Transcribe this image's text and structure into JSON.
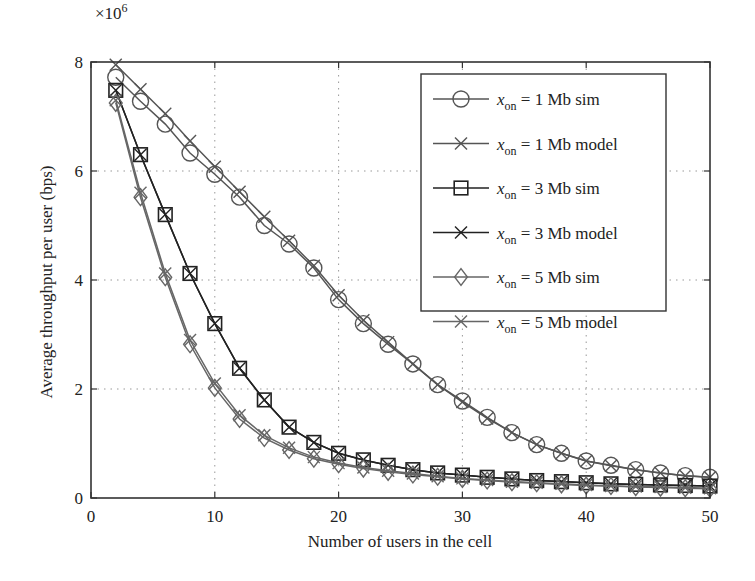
{
  "chart_data": {
    "type": "line",
    "title": "",
    "xlabel": "Number of users in the cell",
    "ylabel": "Average throughput per user (bps)",
    "y_multiplier_label": "×10^6",
    "y_multiplier_base": "×10",
    "y_multiplier_exp": "6",
    "xlim": [
      0,
      50
    ],
    "ylim": [
      0,
      8
    ],
    "xticks": [
      0,
      10,
      20,
      30,
      40,
      50
    ],
    "yticks": [
      0,
      2,
      4,
      6,
      8
    ],
    "grid": true,
    "grid_style": "dotted",
    "legend_position": "upper right (inside)",
    "x": [
      2,
      4,
      6,
      8,
      10,
      12,
      14,
      16,
      18,
      20,
      22,
      24,
      26,
      28,
      30,
      32,
      34,
      36,
      38,
      40,
      42,
      44,
      46,
      48,
      50
    ],
    "series": [
      {
        "name": "x_on = 1 Mb sim",
        "label_var": "x",
        "label_sub": "on",
        "label_rest": " = 1 Mb sim",
        "marker": "circle",
        "color": "#555555",
        "values": [
          7.72,
          7.28,
          6.86,
          6.33,
          5.94,
          5.52,
          5.0,
          4.66,
          4.22,
          3.64,
          3.2,
          2.82,
          2.46,
          2.08,
          1.78,
          1.48,
          1.2,
          0.98,
          0.82,
          0.68,
          0.6,
          0.52,
          0.46,
          0.41,
          0.38
        ]
      },
      {
        "name": "x_on = 1 Mb model",
        "label_var": "x",
        "label_sub": "on",
        "label_rest": " = 1 Mb model",
        "marker": "x",
        "color": "#555555",
        "values": [
          7.95,
          7.5,
          7.05,
          6.55,
          6.08,
          5.62,
          5.16,
          4.72,
          4.26,
          3.72,
          3.26,
          2.86,
          2.46,
          2.08,
          1.76,
          1.46,
          1.2,
          0.98,
          0.82,
          0.68,
          0.59,
          0.52,
          0.46,
          0.41,
          0.38
        ]
      },
      {
        "name": "x_on = 3 Mb sim",
        "label_var": "x",
        "label_sub": "on",
        "label_rest": " = 3 Mb sim",
        "marker": "square",
        "color": "#222222",
        "values": [
          7.48,
          6.3,
          5.2,
          4.12,
          3.2,
          2.38,
          1.8,
          1.3,
          1.02,
          0.82,
          0.7,
          0.6,
          0.52,
          0.46,
          0.42,
          0.38,
          0.35,
          0.32,
          0.3,
          0.28,
          0.26,
          0.25,
          0.24,
          0.23,
          0.22
        ]
      },
      {
        "name": "x_on = 3 Mb model",
        "label_var": "x",
        "label_sub": "on",
        "label_rest": " = 3 Mb model",
        "marker": "x",
        "color": "#222222",
        "values": [
          7.48,
          6.3,
          5.2,
          4.12,
          3.2,
          2.38,
          1.8,
          1.3,
          1.02,
          0.82,
          0.7,
          0.6,
          0.52,
          0.46,
          0.42,
          0.38,
          0.35,
          0.32,
          0.3,
          0.28,
          0.26,
          0.25,
          0.24,
          0.23,
          0.22
        ]
      },
      {
        "name": "x_on = 5 Mb sim",
        "label_var": "x",
        "label_sub": "on",
        "label_rest": " = 5 Mb sim",
        "marker": "diamond",
        "color": "#666666",
        "values": [
          7.25,
          5.52,
          4.05,
          2.82,
          2.02,
          1.45,
          1.1,
          0.88,
          0.72,
          0.62,
          0.54,
          0.48,
          0.43,
          0.39,
          0.35,
          0.32,
          0.29,
          0.27,
          0.25,
          0.23,
          0.22,
          0.2,
          0.19,
          0.18,
          0.17
        ]
      },
      {
        "name": "x_on = 5 Mb model",
        "label_var": "x",
        "label_sub": "on",
        "label_rest": " = 5 Mb model",
        "marker": "x",
        "color": "#666666",
        "values": [
          7.3,
          5.6,
          4.12,
          2.9,
          2.1,
          1.52,
          1.15,
          0.92,
          0.75,
          0.64,
          0.56,
          0.5,
          0.45,
          0.4,
          0.36,
          0.33,
          0.3,
          0.28,
          0.26,
          0.24,
          0.22,
          0.21,
          0.2,
          0.19,
          0.18
        ]
      }
    ]
  },
  "colors": {
    "axis": "#333333",
    "grid": "#999999",
    "background": "#ffffff"
  }
}
